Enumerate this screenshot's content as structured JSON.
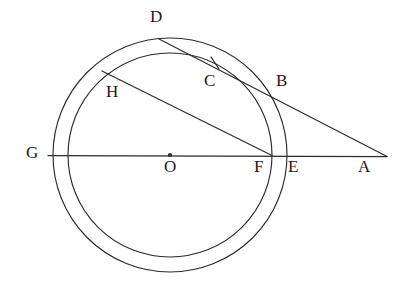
{
  "figure": {
    "background_color": "#ffffff",
    "stroke_color": "#2b2b33",
    "label_color": "#1a1a22",
    "width": 412,
    "height": 293
  },
  "circles": [
    {
      "name": "outer-circle",
      "cx": 170,
      "cy": 155,
      "r": 117
    },
    {
      "name": "inner-circle",
      "cx": 170,
      "cy": 155,
      "r": 102
    }
  ],
  "center": {
    "name": "center-point-O",
    "cx": 170,
    "cy": 155,
    "dot_radius": 2.1
  },
  "segments": [
    {
      "name": "diameter-line-GA",
      "x1": 48,
      "y1": 155.5,
      "x2": 387,
      "y2": 156.5
    },
    {
      "name": "secant-line-DA",
      "x1": 159,
      "y1": 39,
      "x2": 387,
      "y2": 156.5
    },
    {
      "name": "chord-line-HF",
      "x1": 102,
      "y1": 71,
      "x2": 272,
      "y2": 155.5
    }
  ],
  "tick": {
    "name": "congruence-tick-at-C",
    "x1": 211,
    "y1": 57,
    "x2": 219,
    "y2": 69
  },
  "labels": [
    {
      "id": "D",
      "text": "D",
      "x": 150,
      "y": 8
    },
    {
      "id": "C",
      "text": "C",
      "x": 204,
      "y": 72
    },
    {
      "id": "B",
      "text": "B",
      "x": 276,
      "y": 72
    },
    {
      "id": "H",
      "text": "H",
      "x": 106,
      "y": 83
    },
    {
      "id": "G",
      "text": "G",
      "x": 26,
      "y": 144
    },
    {
      "id": "O",
      "text": "O",
      "x": 164,
      "y": 158
    },
    {
      "id": "F",
      "text": "F",
      "x": 254,
      "y": 158
    },
    {
      "id": "E",
      "text": "E",
      "x": 288,
      "y": 158
    },
    {
      "id": "A",
      "text": "A",
      "x": 358,
      "y": 158
    }
  ]
}
